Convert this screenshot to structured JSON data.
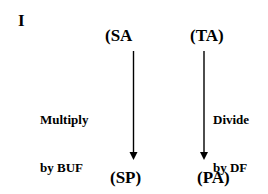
{
  "panel_label": "I",
  "nodes": {
    "top_left": "(SA",
    "top_right": "(TA)",
    "bottom_left": "(SP)",
    "bottom_right": "(PA)"
  },
  "edges": {
    "left": {
      "from": "(SA",
      "to": "(SP)",
      "label_line1": "Multiply",
      "label_line2": "by BUF"
    },
    "right": {
      "from": "(TA)",
      "to": "(PA)",
      "label_line1": "Divide",
      "label_line2": "by DF"
    }
  }
}
